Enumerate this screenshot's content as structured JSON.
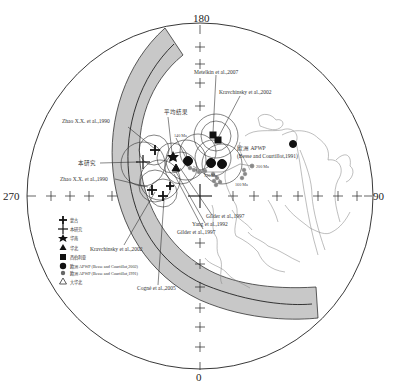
{
  "figure": {
    "type": "polar stereographic projection of paleomagnetic poles",
    "axis_labels": {
      "top": "180",
      "bottom": "0",
      "left": "270",
      "right": "90"
    }
  },
  "annotations": {
    "zhao_1990_upper": "Zhao X.X. et al.,1990",
    "zhao_1990_lower": "Zhao X.X. et al.,1990",
    "this_study": "本研究",
    "mean_result": "平均结果",
    "age_140": "140 Ma",
    "metelkin_2007": "Metelkin et al.,2007",
    "kravchinsky_2002_upper": "Kravchinsky et al.,2002",
    "europe_apwp_line1": "欧洲 APWP",
    "europe_apwp_line2": "(Besse and Courtillot,1991)",
    "age_200": "200 Ma",
    "age_160": "160 Ma",
    "age_130": "130 Ma",
    "gilder_1997_a": "Gilder et al.,1997",
    "yang_1992": "Yang et al.,1992",
    "gilder_1997_b": "Gilder et al.,1997",
    "kravchinsky_2002_lower": "Kravchinsky et al.,2002",
    "cogne_2005": "Cogné et al.,2005"
  },
  "legend": {
    "items": [
      {
        "symbol": "cross-bold",
        "label": "蒙古"
      },
      {
        "symbol": "cross-star",
        "label": "本研究"
      },
      {
        "symbol": "star",
        "label": "华南"
      },
      {
        "symbol": "triangle",
        "label": "华北"
      },
      {
        "symbol": "square",
        "label": "西伯利亚"
      },
      {
        "symbol": "circle-large",
        "label": "欧洲 APWP (Besse and Courtillot,2002)"
      },
      {
        "symbol": "circle-small",
        "label": "欧洲 APWP (Besse and Courtillot,1991)"
      },
      {
        "symbol": "triangle-outline",
        "label": "大华北"
      }
    ]
  },
  "colors": {
    "band_fill": "#c8c8c8",
    "line": "#222222",
    "coast": "#777777",
    "grey_point": "#888888"
  }
}
